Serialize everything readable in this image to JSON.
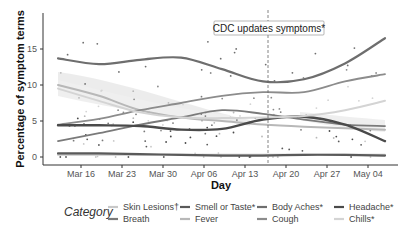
{
  "chart_data": {
    "type": "line",
    "title": "",
    "xlabel": "Day",
    "ylabel": "Percentage of symptom terms",
    "ylim": [
      0,
      18.5
    ],
    "yticks": [
      0,
      5,
      10,
      15
    ],
    "xticks": [
      "Mar 16",
      "Mar 23",
      "Mar 30",
      "Apr 06",
      "Apr 13",
      "Apr 20",
      "Apr 27",
      "May 04"
    ],
    "grid": false,
    "legend_position": "bottom",
    "legend_title": "Category",
    "annotation": {
      "text": "CDC updates symptoms*",
      "x": "Apr 17",
      "style": "dashed vertical line"
    },
    "x": [
      "Mar 13",
      "Mar 20",
      "Mar 27",
      "Apr 03",
      "Apr 10",
      "Apr 17",
      "Apr 24",
      "May 01",
      "May 07"
    ],
    "series": [
      {
        "name": "Skin Lesions†",
        "color": "#c8c8c8",
        "values": [
          0.3,
          0.3,
          0.3,
          0.3,
          0.3,
          0.3,
          0.3,
          0.3,
          0.3
        ]
      },
      {
        "name": "Breath",
        "color": "#7a7a7a",
        "values": [
          2.2,
          3.3,
          4.5,
          5.5,
          6.5,
          6.0,
          5.2,
          4.5,
          4.3
        ]
      },
      {
        "name": "Smell or Taste*",
        "color": "#5a5a5a",
        "values": [
          0.5,
          0.5,
          0.4,
          0.3,
          0.2,
          0.2,
          0.3,
          0.3,
          0.2
        ]
      },
      {
        "name": "Fever",
        "color": "#b8b8b8",
        "values": [
          10.0,
          8.5,
          6.5,
          5.5,
          5.0,
          4.5,
          4.2,
          4.0,
          3.8
        ]
      },
      {
        "name": "Body Aches*",
        "color": "#6e6e6e",
        "values": [
          13.7,
          12.9,
          13.5,
          13.8,
          12.2,
          10.5,
          10.8,
          13.0,
          16.5
        ]
      },
      {
        "name": "Cough",
        "color": "#8c8c8c",
        "values": [
          4.5,
          5.3,
          6.5,
          7.5,
          8.5,
          9.0,
          9.0,
          10.5,
          11.5
        ]
      },
      {
        "name": "Headache*",
        "color": "#4a4a4a",
        "values": [
          4.4,
          4.4,
          4.3,
          3.8,
          3.9,
          5.2,
          5.6,
          4.5,
          2.2
        ]
      },
      {
        "name": "Chills*",
        "color": "#d4d4d4",
        "values": [
          9.5,
          7.8,
          6.2,
          5.5,
          5.4,
          5.5,
          5.7,
          6.5,
          7.8
        ]
      }
    ]
  },
  "axes": {
    "xlabel": "Day",
    "ylabel": "Percentage of symptom terms",
    "yticks": [
      "0",
      "5",
      "10",
      "15"
    ],
    "xticks": [
      "Mar 16",
      "Mar 23",
      "Mar 30",
      "Apr 06",
      "Apr 13",
      "Apr 20",
      "Apr 27",
      "May 04"
    ]
  },
  "annotation": {
    "text": "CDC updates symptoms*"
  },
  "legend": {
    "title": "Category",
    "items": [
      {
        "label": "Skin Lesions†",
        "color": "#c8c8c8"
      },
      {
        "label": "Smell or Taste*",
        "color": "#5a5a5a"
      },
      {
        "label": "Body Aches*",
        "color": "#6e6e6e"
      },
      {
        "label": "Headache*",
        "color": "#4a4a4a"
      },
      {
        "label": "Breath",
        "color": "#7a7a7a"
      },
      {
        "label": "Fever",
        "color": "#b8b8b8"
      },
      {
        "label": "Cough",
        "color": "#8c8c8c"
      },
      {
        "label": "Chills*",
        "color": "#d4d4d4"
      }
    ]
  }
}
